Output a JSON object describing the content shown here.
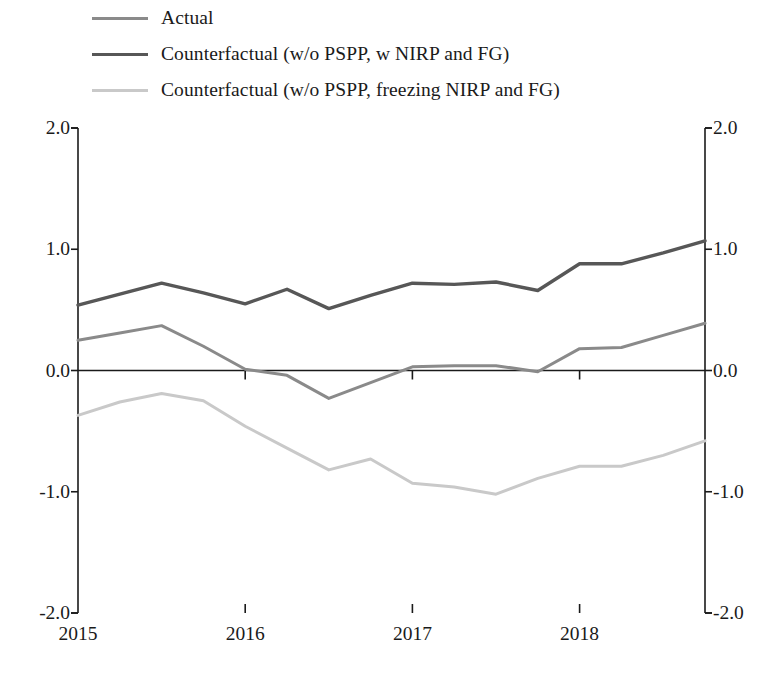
{
  "chart_data": {
    "type": "line",
    "title": "",
    "subtitle": "",
    "xlabel": "",
    "ylabel": "",
    "xlim": [
      "2015Q1",
      "2018Q4"
    ],
    "ylim": [
      -2.0,
      2.0
    ],
    "ytick_labels_left": [
      "2.0",
      "1.0",
      "0.0",
      "-1.0",
      "-2.0"
    ],
    "ytick_labels_right": [
      "2.0",
      "1.0",
      "0.0",
      "-1.0",
      "-2.0"
    ],
    "ytick_values": [
      2.0,
      1.0,
      0.0,
      -1.0,
      -2.0
    ],
    "xtick_labels": [
      "2015",
      "2016",
      "2017",
      "2018"
    ],
    "xtick_values": [
      0,
      4,
      8,
      12
    ],
    "x": [
      "2015Q1",
      "2015Q2",
      "2015Q3",
      "2015Q4",
      "2016Q1",
      "2016Q2",
      "2016Q3",
      "2016Q4",
      "2017Q1",
      "2017Q2",
      "2017Q3",
      "2017Q4",
      "2018Q1",
      "2018Q2",
      "2018Q3",
      "2018Q4"
    ],
    "grid": false,
    "zero_line": true,
    "legend_position": "top-left",
    "series": [
      {
        "name": "Actual",
        "color": "#8a8a8a",
        "width": 3.0,
        "values": [
          0.25,
          0.31,
          0.37,
          0.2,
          0.01,
          -0.04,
          -0.23,
          -0.1,
          0.03,
          0.04,
          0.04,
          -0.01,
          0.18,
          0.19,
          0.29,
          0.39
        ]
      },
      {
        "name": "Counterfactual (w/o PSPP, w NIRP and FG)",
        "color": "#575757",
        "width": 3.4,
        "values": [
          0.54,
          0.63,
          0.72,
          0.64,
          0.55,
          0.67,
          0.51,
          0.62,
          0.72,
          0.71,
          0.73,
          0.66,
          0.88,
          0.88,
          0.97,
          1.07
        ]
      },
      {
        "name": "Counterfactual (w/o PSPP, freezing NIRP and FG)",
        "color": "#c9c9c9",
        "width": 3.0,
        "values": [
          -0.37,
          -0.26,
          -0.19,
          -0.25,
          -0.46,
          -0.64,
          -0.82,
          -0.73,
          -0.93,
          -0.96,
          -1.02,
          -0.89,
          -0.79,
          -0.79,
          -0.7,
          -0.58
        ]
      }
    ]
  },
  "legend": {
    "entries": [
      {
        "label": "Actual"
      },
      {
        "label": "Counterfactual (w/o PSPP, w NIRP and FG)"
      },
      {
        "label": "Counterfactual (w/o PSPP, freezing NIRP and FG)"
      }
    ]
  },
  "axes": {
    "left_ticks": [
      "2.0",
      "1.0",
      "0.0",
      "-1.0",
      "-2.0"
    ],
    "right_ticks": [
      "2.0",
      "1.0",
      "0.0",
      "-1.0",
      "-2.0"
    ],
    "bottom_ticks": [
      "2015",
      "2016",
      "2017",
      "2018"
    ]
  },
  "style": {
    "axis_color": "#1a1a1a",
    "background": "#ffffff"
  }
}
